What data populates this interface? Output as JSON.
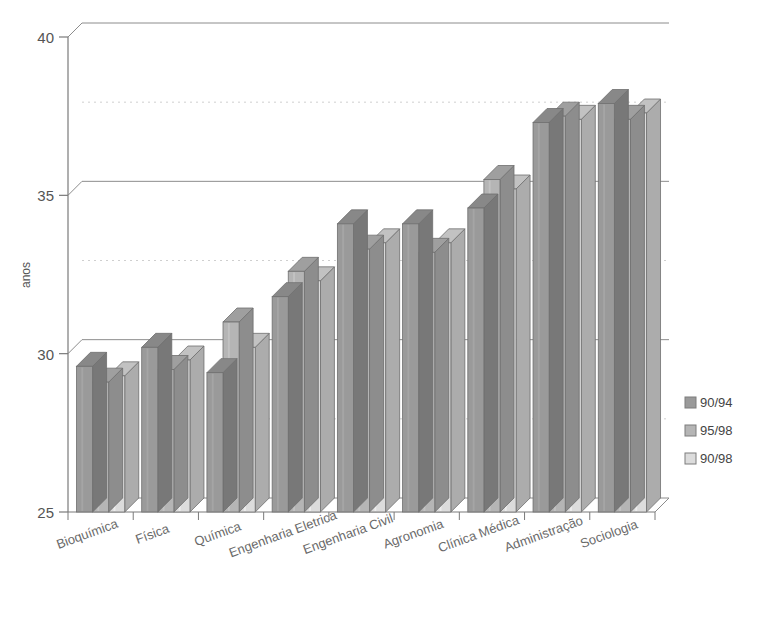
{
  "chart_data": {
    "type": "bar",
    "title": "",
    "xlabel": "",
    "ylabel": "anos",
    "ylim": [
      25,
      40
    ],
    "yticks": [
      25,
      30,
      35,
      40
    ],
    "ytick_labels": [
      "25",
      "30",
      "35",
      "40"
    ],
    "grid": "horizontal-major-and-minor",
    "legend_position": "right",
    "three_d": true,
    "categories": [
      "Bioquímica",
      "Física",
      "Química",
      "Engenharia Eletrica",
      "Engenharia Civil",
      "Agronomia",
      "Clínica Médica",
      "Administração",
      "Sociologia"
    ],
    "series": [
      {
        "name": "90/94",
        "color": "#9a9a9a",
        "values": [
          29.6,
          30.2,
          29.4,
          31.8,
          34.1,
          34.1,
          34.6,
          37.3,
          37.9
        ]
      },
      {
        "name": "95/98",
        "color": "#b5b5b5",
        "values": [
          29.1,
          29.5,
          31.0,
          32.6,
          33.3,
          33.2,
          35.5,
          37.5,
          37.4
        ]
      },
      {
        "name": "90/98",
        "color": "#dcdcdc",
        "values": [
          29.3,
          29.8,
          30.2,
          32.3,
          33.5,
          33.5,
          35.2,
          37.4,
          37.6
        ]
      }
    ]
  },
  "axis": {
    "y_title": "anos"
  },
  "legend": {
    "items": [
      {
        "label": "90/94",
        "swatch": "#9a9a9a"
      },
      {
        "label": "95/98",
        "swatch": "#b5b5b5"
      },
      {
        "label": "90/98",
        "swatch": "#dcdcdc"
      }
    ]
  },
  "page": {
    "title_fragment": ""
  }
}
